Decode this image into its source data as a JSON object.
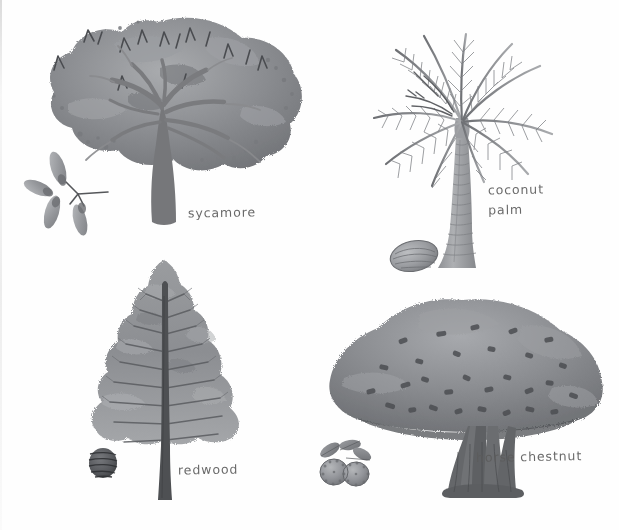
{
  "plate": {
    "title": "Tree identification illustration plate",
    "medium": "grayscale watercolour and pencil botanical illustration",
    "background_color": "#fefefe",
    "ink_color": "#5c5c5c",
    "width": 619,
    "height": 530
  },
  "specimens": [
    {
      "id": "sycamore",
      "label": "sycamore",
      "label_lines": "sycamore",
      "position": "top-left",
      "canopy_shape": "broad billowing rounded crown",
      "trunk": "single thick trunk branching into spreading limbs",
      "seed": {
        "name": "sycamore-samara",
        "description": "winged seed keys radiating from a short stem"
      },
      "tones": {
        "canopy_dark": "#6f7175",
        "canopy_mid": "#8e9094",
        "canopy_light": "#aeb0b3",
        "trunk": "#76777a"
      }
    },
    {
      "id": "coconut-palm",
      "label": "coconut palm",
      "label_lines": "coconut\npalm",
      "position": "top-right",
      "canopy_shape": "radiating feathered fronds",
      "trunk": "tall slender ringed trunk flaring at the base",
      "seed": {
        "name": "coconut",
        "description": "oval husked coconut resting on the ground"
      },
      "tones": {
        "canopy_dark": "#6b6d71",
        "canopy_mid": "#8d8f93",
        "canopy_light": "#b0b2b5",
        "trunk": "#9a9ca0"
      }
    },
    {
      "id": "redwood",
      "label": "redwood",
      "label_lines": "redwood",
      "position": "bottom-left",
      "canopy_shape": "tall narrow conical crown",
      "trunk": "straight dark columnar trunk running to the apex",
      "seed": {
        "name": "redwood-cone",
        "description": "small dark rounded cone"
      },
      "tones": {
        "canopy_dark": "#74767a",
        "canopy_mid": "#949699",
        "canopy_light": "#b3b5b8",
        "trunk": "#4e5053"
      }
    },
    {
      "id": "horse-chestnut",
      "label": "horse chestnut",
      "label_lines": "horse chestnut",
      "position": "bottom-right",
      "canopy_shape": "wide low dome with dense dark leaf flecks",
      "trunk": "short trunk splitting into several upright stems",
      "seed": {
        "name": "conker",
        "description": "pair of conkers with palmate leaves above"
      },
      "tones": {
        "canopy_dark": "#6a6c70",
        "canopy_mid": "#8a8c90",
        "canopy_light": "#a9abae",
        "trunk": "#65676a"
      }
    }
  ]
}
